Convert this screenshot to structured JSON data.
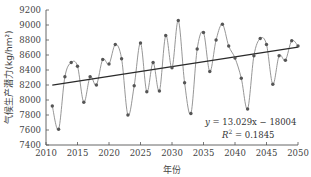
{
  "chart_data": {
    "type": "line",
    "title": "",
    "xlabel": "年份",
    "ylabel": "气候生产潜力(kg/hm²)",
    "xlim": [
      2010,
      2050
    ],
    "ylim": [
      7400,
      9200
    ],
    "xticks": [
      2010,
      2015,
      2020,
      2025,
      2030,
      2035,
      2040,
      2045,
      2050
    ],
    "yticks": [
      7400,
      7600,
      7800,
      8000,
      8200,
      8400,
      8600,
      8800,
      9000,
      9200
    ],
    "grid": false,
    "series": [
      {
        "name": "气候生产潜力",
        "x": [
          2011,
          2012,
          2013,
          2014,
          2015,
          2016,
          2017,
          2018,
          2019,
          2020,
          2021,
          2022,
          2023,
          2024,
          2025,
          2026,
          2027,
          2028,
          2029,
          2030,
          2031,
          2032,
          2033,
          2034,
          2035,
          2036,
          2037,
          2038,
          2039,
          2040,
          2041,
          2042,
          2043,
          2044,
          2045,
          2046,
          2047,
          2048,
          2049,
          2050
        ],
        "values": [
          7920,
          7610,
          8310,
          8500,
          8450,
          7970,
          8310,
          8200,
          8540,
          8480,
          8740,
          8550,
          7800,
          8190,
          8760,
          8110,
          8500,
          8120,
          8860,
          8430,
          9060,
          8230,
          7820,
          8680,
          8900,
          8380,
          8800,
          9010,
          8720,
          8560,
          8290,
          7880,
          8590,
          8820,
          8740,
          8210,
          8590,
          8530,
          8790,
          8720
        ],
        "color": "#8a8a8a",
        "marker_color": "#555555",
        "smooth": true
      }
    ],
    "trendline": {
      "slope": 13.029,
      "intercept": -18004,
      "x_range": [
        2011,
        2050
      ],
      "color": "#2a2a2a"
    },
    "annotations": {
      "equation": {
        "lhs": "y",
        "rhs": " = 13.029x − 18004"
      },
      "r2": {
        "lhs": "R",
        "sup": "2",
        "rhs": " = 0.1845"
      }
    },
    "legend": "none"
  }
}
